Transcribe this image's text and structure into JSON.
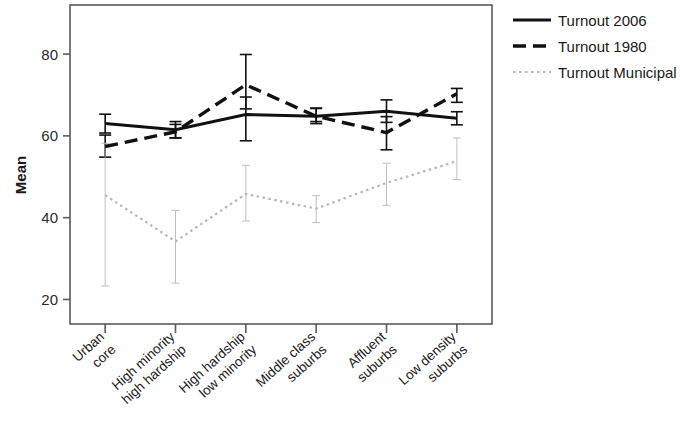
{
  "chart_data": {
    "type": "line",
    "title": "",
    "xlabel": "",
    "ylabel": "Mean",
    "ylim": [
      14,
      92
    ],
    "yticks": [
      20,
      40,
      60,
      80
    ],
    "ytick_labels": [
      "20",
      "40",
      "60",
      "80"
    ],
    "grid": false,
    "legend_position": "right",
    "error_bars": "95% CI",
    "categories": [
      "Urban\ncore",
      "High minority\nhigh hardship",
      "High hardship\nlow minority",
      "Middle class\nsuburbs",
      "Affluent\nsuburbs",
      "Low density\nsuburbs"
    ],
    "category_lines": [
      [
        "Urban",
        "core"
      ],
      [
        "High minority",
        "high hardship"
      ],
      [
        "High hardship",
        "low minority"
      ],
      [
        "Middle class",
        "suburbs"
      ],
      [
        "Affluent",
        "suburbs"
      ],
      [
        "Low density",
        "suburbs"
      ]
    ],
    "series": [
      {
        "name": "Turnout 2006",
        "style": "solid",
        "color": "#111111",
        "values": [
          63.0,
          61.5,
          65.2,
          64.8,
          66.0,
          64.3
        ],
        "err_low": [
          60.7,
          59.5,
          58.8,
          63.0,
          63.3,
          62.7
        ],
        "err_high": [
          65.3,
          63.5,
          69.5,
          66.7,
          68.8,
          65.9
        ]
      },
      {
        "name": "Turnout 1980",
        "style": "dashed",
        "color": "#111111",
        "values": [
          57.4,
          61.0,
          72.5,
          64.8,
          60.8,
          70.3
        ],
        "err_low": [
          54.8,
          59.5,
          66.6,
          63.5,
          56.6,
          68.2
        ],
        "err_high": [
          60.2,
          62.8,
          79.9,
          66.8,
          64.7,
          71.6
        ]
      },
      {
        "name": "Turnout Municipal",
        "style": "dotted",
        "color": "#b7b7b7",
        "values": [
          45.5,
          34.2,
          45.8,
          42.2,
          48.5,
          53.8
        ],
        "err_low": [
          23.3,
          24.0,
          39.2,
          38.8,
          43.0,
          49.3
        ],
        "err_high": [
          58.2,
          41.8,
          52.8,
          45.4,
          53.3,
          59.5
        ]
      }
    ]
  },
  "legend": {
    "items": [
      {
        "label": "Turnout 2006"
      },
      {
        "label": "Turnout 1980"
      },
      {
        "label": "Turnout Municipal"
      }
    ]
  },
  "axes": {
    "y_axis_title": "Mean"
  }
}
